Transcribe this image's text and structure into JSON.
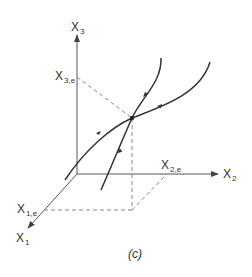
{
  "figure": {
    "caption": "(c)",
    "axes": {
      "x1": {
        "label": "X",
        "sub": "1"
      },
      "x2": {
        "label": "X",
        "sub": "2"
      },
      "x3": {
        "label": "X",
        "sub": "3"
      }
    },
    "equilibrium_labels": {
      "x1e": {
        "label": "X",
        "sub": "1,e"
      },
      "x2e": {
        "label": "X",
        "sub": "2,e"
      },
      "x3e": {
        "label": "X",
        "sub": "3,e"
      }
    },
    "trajectories": [
      {
        "name": "steep-trajectory",
        "direction": "toward equilibrium from below, away above"
      },
      {
        "name": "shallow-trajectory",
        "direction": "toward equilibrium from both sides"
      }
    ],
    "colors": {
      "axis": "#555555",
      "curve": "#333333",
      "dashed": "#888888"
    }
  }
}
